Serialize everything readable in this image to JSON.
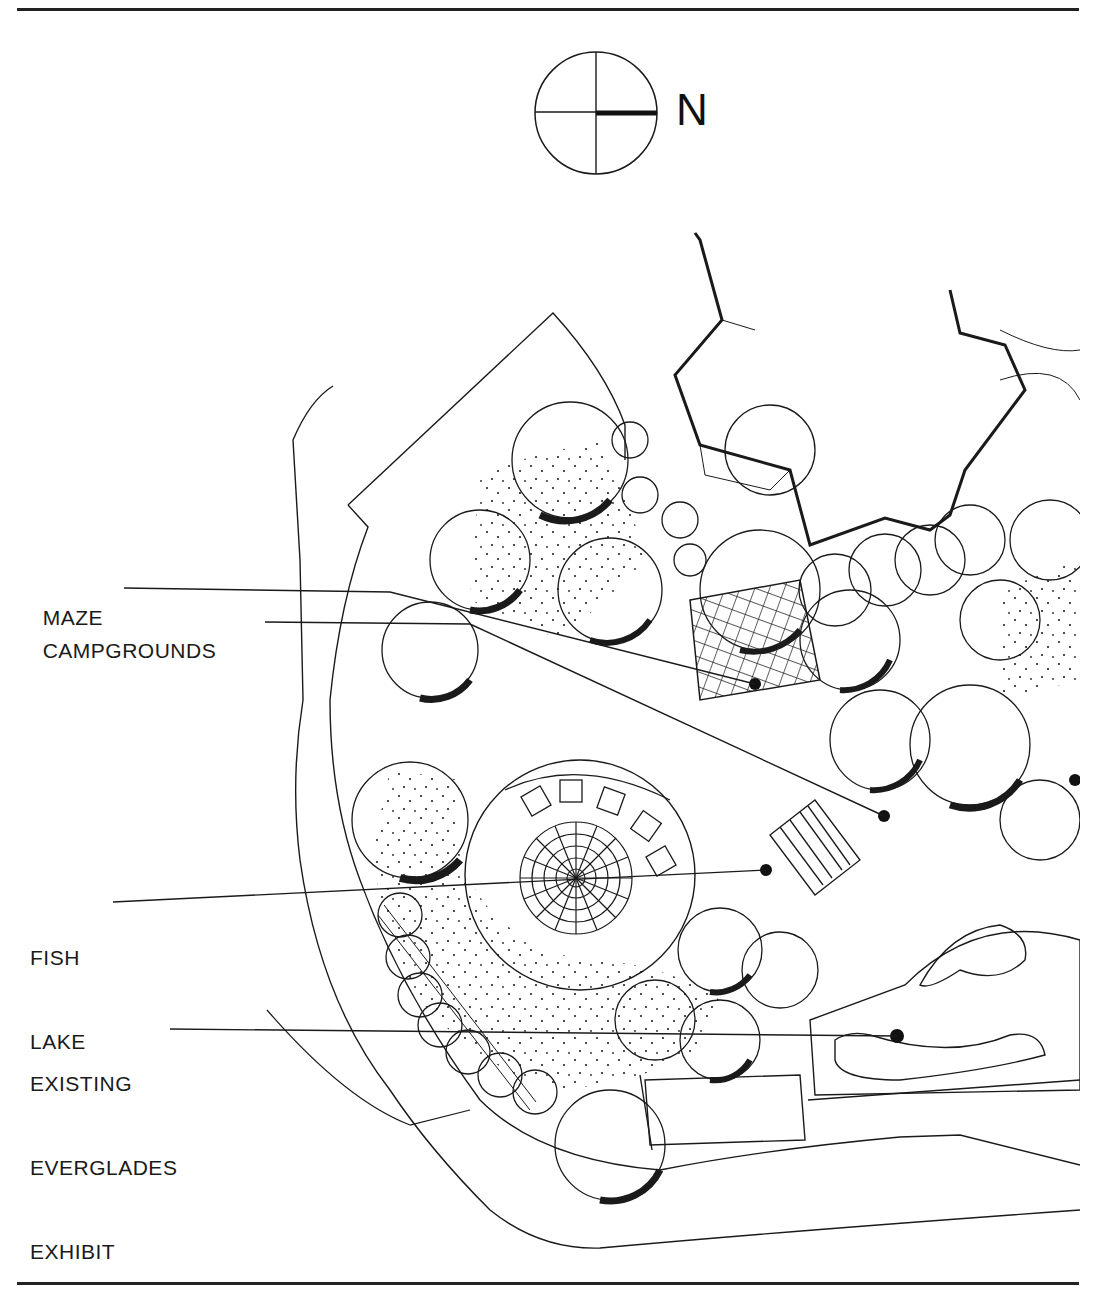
{
  "figure": {
    "type": "landscape site plan",
    "north_arrow": {
      "letter": "N",
      "orientation": "north points right"
    },
    "callouts": [
      {
        "id": "maze",
        "label": "MAZE",
        "lines": [
          "MAZE"
        ]
      },
      {
        "id": "campgrounds",
        "label": "CAMPGROUNDS",
        "lines": [
          "CAMPGROUNDS"
        ]
      },
      {
        "id": "fish-lake",
        "label": "FISH LAKE",
        "lines": [
          "FISH",
          "LAKE"
        ]
      },
      {
        "id": "existing-everglades-exhibit",
        "label": "EXISTING EVERGLADES EXHIBIT",
        "lines": [
          "EXISTING",
          "EVERGLADES",
          "EXHIBIT"
        ]
      }
    ],
    "colors": {
      "ink": "#1a1a1a",
      "paper": "#ffffff"
    }
  },
  "labels": {
    "north": "N",
    "maze": "MAZE",
    "campgrounds": "CAMPGROUNDS",
    "fish_1": "FISH",
    "fish_2": "LAKE",
    "exhibit_1": "EXISTING",
    "exhibit_2": "EVERGLADES",
    "exhibit_3": "EXHIBIT"
  }
}
